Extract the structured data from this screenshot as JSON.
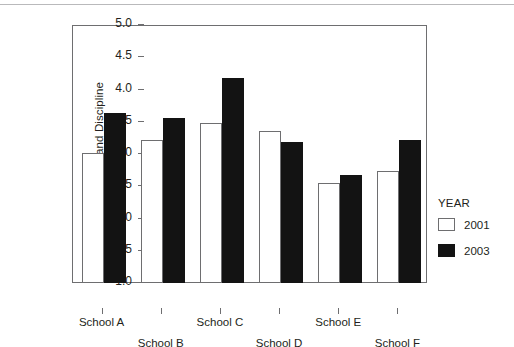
{
  "chart_data": {
    "type": "bar",
    "title": "",
    "subtitle": "",
    "xlabel": "",
    "ylabel": "Order and Discipline",
    "categories": [
      "School A",
      "School B",
      "School C",
      "School D",
      "School E",
      "School F"
    ],
    "series": [
      {
        "name": "2001",
        "color": "#ffffff",
        "values": [
          3.02,
          3.22,
          3.48,
          3.35,
          2.55,
          2.73
        ]
      },
      {
        "name": "2003",
        "color": "#131313",
        "values": [
          3.63,
          3.56,
          4.18,
          3.19,
          2.67,
          3.22
        ]
      }
    ],
    "ylim": [
      1.0,
      5.0
    ],
    "ytick_labels": [
      "5.0",
      "4.5",
      "4.0",
      "3.5",
      "3.0",
      "2.5",
      "2.0",
      "1.5",
      "1.0"
    ],
    "ytick_values": [
      5.0,
      4.5,
      4.0,
      3.5,
      3.0,
      2.5,
      2.0,
      1.5,
      1.0
    ],
    "grid": false,
    "legend_position": "right",
    "legend_title": "YEAR",
    "legend_entries": [
      "2001",
      "2003"
    ],
    "x_label_layout": "staggered-two-rows"
  },
  "axis": {
    "y_title": "Order and Discipline"
  },
  "legend": {
    "title": "YEAR",
    "items": [
      {
        "label": "2001"
      },
      {
        "label": "2003"
      }
    ]
  }
}
